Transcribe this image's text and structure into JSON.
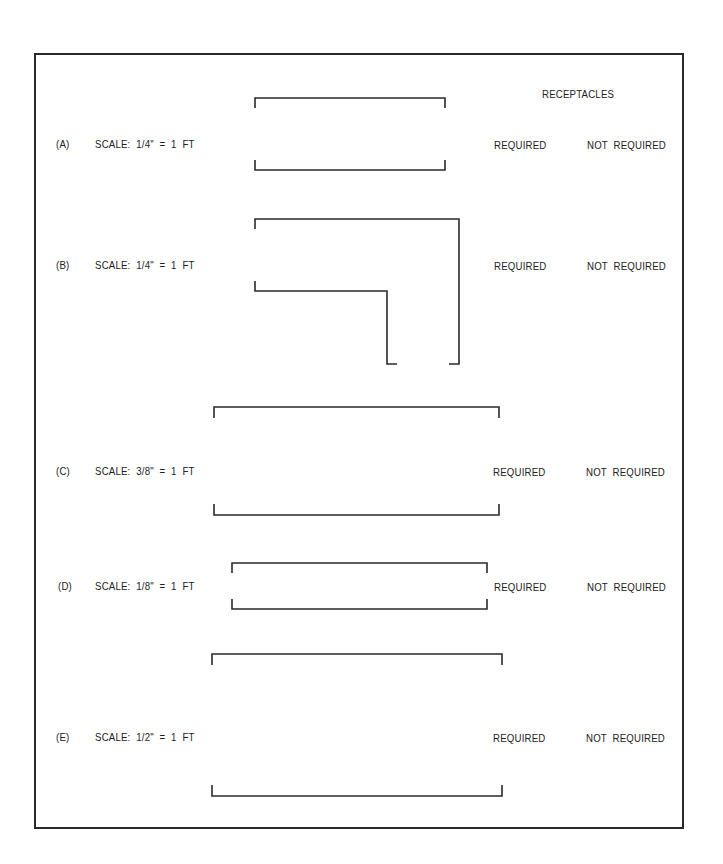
{
  "header": {
    "receptacles_label": "RECEPTACLES"
  },
  "items": [
    {
      "id": "A",
      "label": "(A)",
      "scale": "SCALE:  1/4\"  =  1  FT",
      "required": "REQUIRED",
      "not_required": "NOT  REQUIRED"
    },
    {
      "id": "B",
      "label": "(B)",
      "scale": "SCALE:  1/4\"  =  1  FT",
      "required": "REQUIRED",
      "not_required": "NOT  REQUIRED"
    },
    {
      "id": "C",
      "label": "(C)",
      "scale": "SCALE:  3/8\"  =  1  FT",
      "required": "REQUIRED",
      "not_required": "NOT  REQUIRED"
    },
    {
      "id": "D",
      "label": "(D)",
      "scale": "SCALE:  1/8\"  =  1  FT",
      "required": "REQUIRED",
      "not_required": "NOT  REQUIRED"
    },
    {
      "id": "E",
      "label": "(E)",
      "scale": "SCALE:  1/2\"  =  1  FT",
      "required": "REQUIRED",
      "not_required": "NOT  REQUIRED"
    }
  ]
}
